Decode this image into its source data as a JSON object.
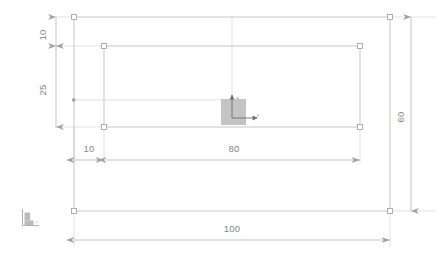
{
  "drawing": {
    "title": "Rectangular plate dimension drawing",
    "units_note": "",
    "background_color": "#ffffff",
    "line_color": "#c2c2c6",
    "marker_color": "#a9a9ae",
    "text_color": "#85858a",
    "fill_color": "#c4c4c4",
    "outer_rectangle": {
      "name": "outer-plate-outline",
      "width_label": "100",
      "height_label": "60"
    },
    "inner_rectangle": {
      "name": "inner-pocket-outline",
      "width_label": "80",
      "height_label": "25"
    },
    "feature_block": {
      "name": "center-block",
      "label": ""
    },
    "dimensions": [
      {
        "id": "top-offset-vertical",
        "value": "10",
        "orientation": "vertical",
        "position": "left-upper"
      },
      {
        "id": "inner-height-vertical",
        "value": "25",
        "orientation": "vertical",
        "position": "left-lower"
      },
      {
        "id": "total-height-vertical",
        "value": "60",
        "orientation": "vertical",
        "position": "right"
      },
      {
        "id": "left-offset-horizontal",
        "value": "10",
        "orientation": "horizontal",
        "position": "middle-left"
      },
      {
        "id": "inner-width-horizontal",
        "value": "80",
        "orientation": "horizontal",
        "position": "middle-center"
      },
      {
        "id": "total-width-horizontal",
        "value": "100",
        "orientation": "horizontal",
        "position": "bottom"
      }
    ],
    "icons": [
      {
        "id": "origin-axis-icon",
        "label": ""
      },
      {
        "id": "coordinate-crosshair-icon",
        "label": ""
      }
    ]
  }
}
